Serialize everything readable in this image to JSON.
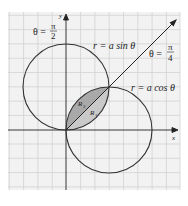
{
  "figure": {
    "type": "polar-curves-intersection",
    "axes": {
      "x_label": "x",
      "y_label": "y"
    },
    "curves": [
      {
        "name": "sine-circle",
        "label": "r = a sin θ"
      },
      {
        "name": "cosine-circle",
        "label": "r = a cos θ"
      }
    ],
    "rays": [
      {
        "name": "ray-pi-over-4",
        "theta_text": "θ =",
        "numerator": "π",
        "denominator": "4"
      }
    ],
    "annotations": {
      "theta_pi_over_2": {
        "theta_text": "θ =",
        "numerator": "π",
        "denominator": "2"
      }
    },
    "regions": [
      {
        "name": "R1",
        "label": "R",
        "subscript": "1",
        "shade": "#c9c9c9"
      },
      {
        "name": "R2",
        "label": "R",
        "subscript": "2",
        "shade": "#a9a9a9"
      }
    ],
    "colors": {
      "grid": "#cfcfcf",
      "grid_bg": "#f2f2f2",
      "curve": "#333333",
      "axis": "#222222"
    }
  }
}
